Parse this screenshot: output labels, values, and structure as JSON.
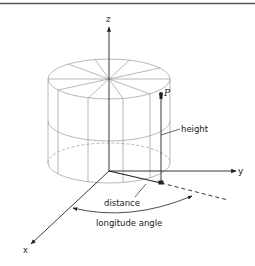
{
  "figure": {
    "type": "cylindrical coordinate system diagram",
    "axes": {
      "x_label": "x",
      "y_label": "y",
      "z_label": "z"
    },
    "point_label": "P",
    "annotations": {
      "height": "height",
      "distance": "distance",
      "longitude_angle": "longitude angle"
    },
    "colors": {
      "ink": "#222222",
      "wireframe": "#9a9a9a",
      "border": "#555555"
    }
  }
}
